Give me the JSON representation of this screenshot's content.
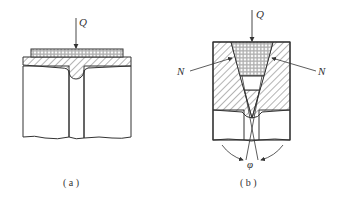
{
  "figure": {
    "panels": [
      {
        "id": "a",
        "caption": "( a )",
        "force_label": "Q"
      },
      {
        "id": "b",
        "caption": "( b )",
        "force_label": "Q",
        "normal_force_left": "N",
        "normal_force_right": "N",
        "angle_label": "φ"
      }
    ],
    "colors": {
      "line": "#333333",
      "background": "#ffffff"
    }
  }
}
